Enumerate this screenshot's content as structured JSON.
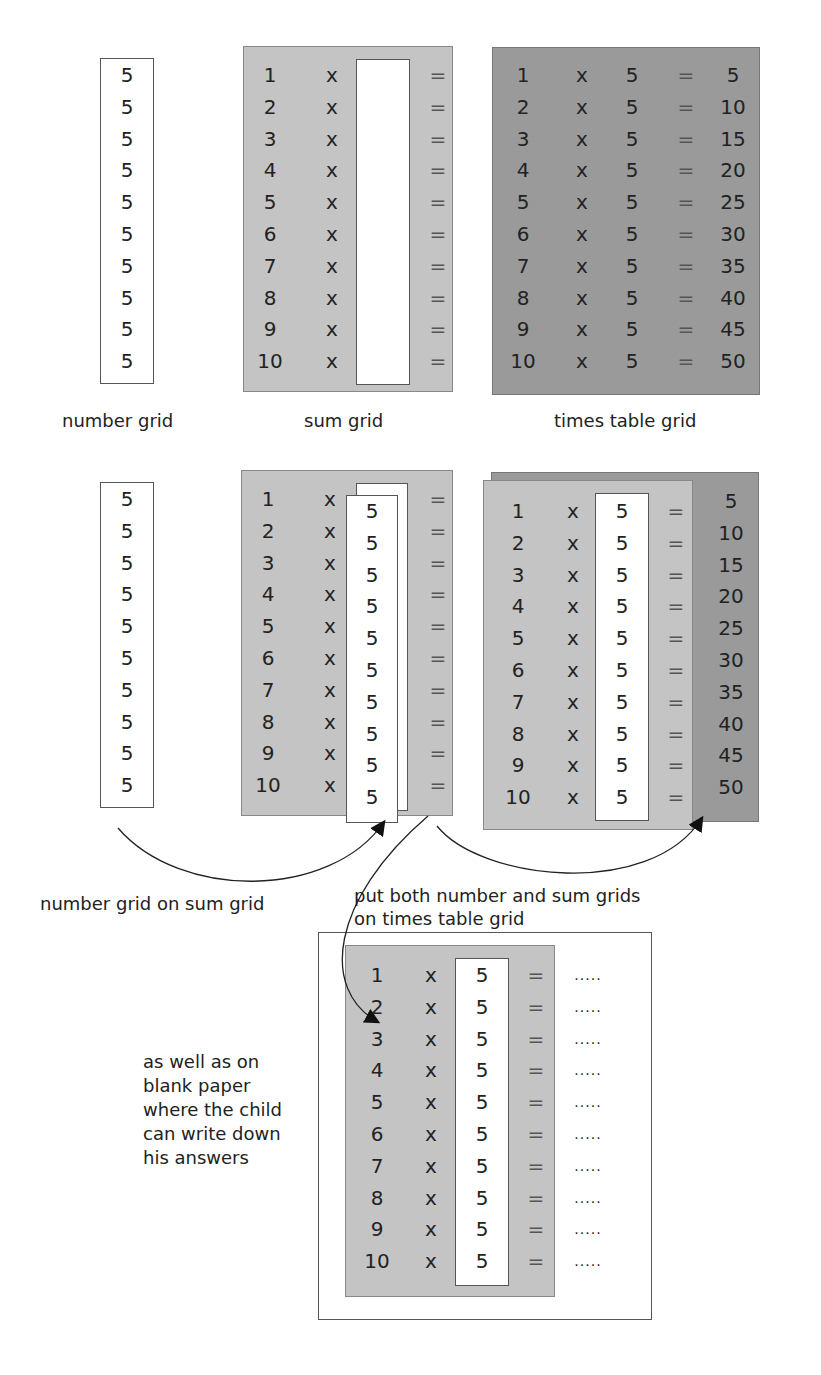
{
  "captions": {
    "number_grid": "number grid",
    "sum_grid": "sum grid",
    "times_table_grid": "times table grid",
    "number_on_sum": "number grid on sum grid",
    "put_both_line1": "put both number and sum grids",
    "put_both_line2": "on times table grid",
    "blank_paper": [
      "as well as on",
      "blank paper",
      "where the child",
      "can write down",
      "his answers"
    ]
  },
  "symbols": {
    "times": "x",
    "equals": "=",
    "blank_answer": "....."
  },
  "multiplier": "5",
  "rows": [
    {
      "n": "1",
      "product": "5"
    },
    {
      "n": "2",
      "product": "10"
    },
    {
      "n": "3",
      "product": "15"
    },
    {
      "n": "4",
      "product": "20"
    },
    {
      "n": "5",
      "product": "25"
    },
    {
      "n": "6",
      "product": "30"
    },
    {
      "n": "7",
      "product": "35"
    },
    {
      "n": "8",
      "product": "40"
    },
    {
      "n": "9",
      "product": "45"
    },
    {
      "n": "10",
      "product": "50"
    }
  ],
  "colors": {
    "sum_grid": "#c4c4c4",
    "times_grid": "#9a9a9a",
    "paper": "#ffffff"
  }
}
